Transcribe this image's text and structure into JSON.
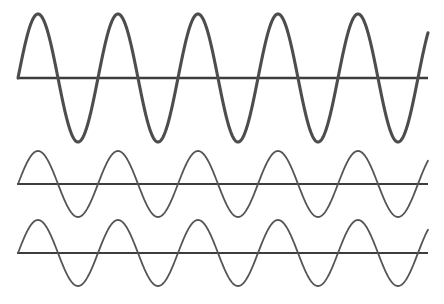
{
  "figure": {
    "background_color": "#ffffff",
    "width": 444,
    "height": 304
  },
  "chart_data": {
    "type": "line",
    "title": "",
    "subtitle": "",
    "xlabel": "",
    "ylabel": "",
    "grid": false,
    "legend_position": "none",
    "axis_color": "#3d3d3d",
    "xlim": [
      0,
      5.125
    ],
    "x_units": "cycles",
    "series": [
      {
        "name": "wave-1-large-amplitude",
        "cycles": 5.125,
        "amplitude_px": 64,
        "phase_deg": 0,
        "stroke_width": 3.1,
        "color": "#4d4d4d",
        "baseline_y": 78,
        "x_start": 18,
        "x_end": 428,
        "peak_y": 14,
        "trough_y": 142
      },
      {
        "name": "wave-2-small-amplitude",
        "cycles": 5.125,
        "amplitude_px": 33,
        "phase_deg": 0,
        "stroke_width": 1.8,
        "color": "#555555",
        "baseline_y": 184,
        "x_start": 18,
        "x_end": 428,
        "peak_y": 151,
        "trough_y": 217
      },
      {
        "name": "wave-3-small-amplitude",
        "cycles": 5.125,
        "amplitude_px": 33,
        "phase_deg": 0,
        "stroke_width": 1.8,
        "color": "#555555",
        "baseline_y": 253,
        "x_start": 18,
        "x_end": 428,
        "peak_y": 220,
        "trough_y": 286
      }
    ],
    "axis_lines": [
      {
        "name": "baseline-wave-1",
        "y": 78,
        "x_start": 17,
        "x_end": 428,
        "stroke_width": 2.4
      },
      {
        "name": "baseline-wave-2",
        "y": 184,
        "x_start": 17,
        "x_end": 428,
        "stroke_width": 2.2
      },
      {
        "name": "baseline-wave-3",
        "y": 253,
        "x_start": 17,
        "x_end": 428,
        "stroke_width": 2.2
      }
    ]
  }
}
